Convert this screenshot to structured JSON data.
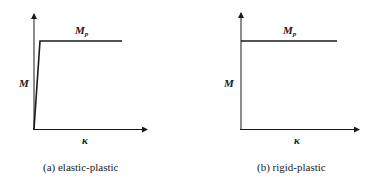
{
  "figures": [
    {
      "id": "a",
      "caption": "(a) elastic-plastic",
      "y_label": "M",
      "x_label": "κ",
      "plateau_label_main": "M",
      "plateau_label_sub": "p",
      "curve": "elastic-plastic"
    },
    {
      "id": "b",
      "caption": "(b) rigid-plastic",
      "y_label": "M",
      "x_label": "κ",
      "plateau_label_main": "M",
      "plateau_label_sub": "p",
      "curve": "rigid-plastic"
    }
  ],
  "colors": {
    "line": "#1a1a1a",
    "background": "#ffffff"
  }
}
